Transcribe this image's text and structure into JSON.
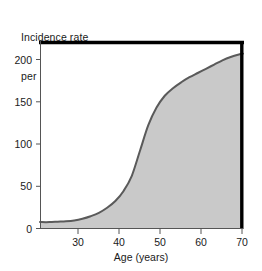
{
  "chart_data": {
    "type": "area",
    "title": "",
    "ylabel_line1": "Incidence rate",
    "ylabel_line2": "per 100,000 (UK)",
    "xlabel": "Age (years)",
    "xlim": [
      20.7,
      70
    ],
    "ylim": [
      0,
      222
    ],
    "grid": false,
    "legend": null,
    "fill_color": "#c9c9c9",
    "line_color": "#5a5a5a",
    "axis_color": "#000000",
    "xticks": [
      30,
      40,
      50,
      60,
      70
    ],
    "xtick_labels": [
      "30",
      "40",
      "50",
      "60",
      "70"
    ],
    "yticks": [
      0,
      50,
      100,
      150,
      200
    ],
    "ytick_labels": [
      "0",
      "50",
      "100",
      "150",
      "200"
    ],
    "x": [
      20.7,
      23,
      25,
      27,
      29,
      31,
      33,
      35,
      37,
      39,
      41,
      43,
      45,
      47,
      49,
      51,
      53,
      55,
      57,
      59,
      61,
      63,
      65,
      67,
      69,
      70
    ],
    "values": [
      7,
      7,
      7.5,
      8,
      9,
      11,
      14,
      18,
      24,
      32,
      44,
      62,
      92,
      122,
      143,
      157,
      166,
      173,
      179,
      184,
      189,
      194,
      199,
      203,
      206,
      207
    ],
    "series": [
      {
        "name": "Incidence rate per 100,000 (UK)",
        "values": [
          7,
          7,
          7.5,
          8,
          9,
          11,
          14,
          18,
          24,
          32,
          44,
          62,
          92,
          122,
          143,
          157,
          166,
          173,
          179,
          184,
          189,
          194,
          199,
          203,
          206,
          207
        ]
      }
    ]
  },
  "axis_geometry": {
    "plot_left": 40,
    "plot_right": 243,
    "plot_top": 41,
    "plot_bottom": 228
  }
}
